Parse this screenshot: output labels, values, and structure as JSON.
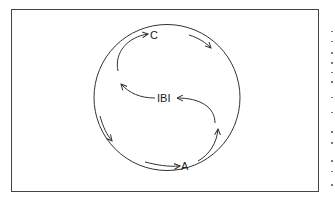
{
  "diagram": {
    "type": "cycle",
    "colors": {
      "stroke": "#333333",
      "frame": "#444444",
      "background": "#ffffff",
      "text": "#222222"
    },
    "frame": {
      "x": 11,
      "y": 9,
      "width": 308,
      "height": 183
    },
    "circle": {
      "cx": 167,
      "cy": 97.5,
      "r": 73
    },
    "nodes": [
      {
        "id": "C",
        "label": "C",
        "x": 153,
        "y": 35
      },
      {
        "id": "IBI",
        "label": "IBI",
        "x": 168,
        "y": 105
      },
      {
        "id": "A",
        "label": "A",
        "x": 184,
        "y": 169
      }
    ],
    "arrows": [
      {
        "name": "arrow-to-C",
        "from": "left-inner",
        "to": "C"
      },
      {
        "name": "arrow-C-outer-right",
        "from": "C",
        "to": "right-outer"
      },
      {
        "name": "arrow-IBI-to-left",
        "from": "IBI",
        "to": "left-inner"
      },
      {
        "name": "arrow-right-to-IBI",
        "from": "right-inner",
        "to": "IBI"
      },
      {
        "name": "arrow-left-outer-down",
        "from": "left-outer",
        "to": "bottom-left"
      },
      {
        "name": "arrow-to-A",
        "from": "bottom",
        "to": "A"
      },
      {
        "name": "arrow-A-up-right",
        "from": "A",
        "to": "right-inner"
      }
    ]
  }
}
